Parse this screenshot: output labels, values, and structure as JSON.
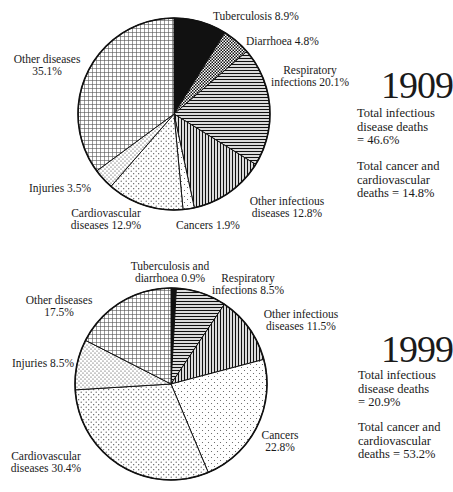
{
  "chart_data": [
    {
      "type": "pie",
      "title": "1909",
      "slices": [
        {
          "label": "Tuberculosis",
          "value": 8.9
        },
        {
          "label": "Diarrhoea",
          "value": 4.8
        },
        {
          "label": "Respiratory infections",
          "value": 20.1
        },
        {
          "label": "Other infectious diseases",
          "value": 12.8
        },
        {
          "label": "Cancers",
          "value": 1.9
        },
        {
          "label": "Cardiovascular diseases",
          "value": 12.9
        },
        {
          "label": "Injuries",
          "value": 3.5
        },
        {
          "label": "Other diseases",
          "value": 35.1
        }
      ],
      "annotations": [
        "Total infectious disease deaths = 46.6%",
        "Total cancer and cardiovascular deaths = 14.8%"
      ]
    },
    {
      "type": "pie",
      "title": "1999",
      "slices": [
        {
          "label": "Tuberculosis and diarrhoea",
          "value": 0.9
        },
        {
          "label": "Respiratory infections",
          "value": 8.5
        },
        {
          "label": "Other infectious diseases",
          "value": 11.5
        },
        {
          "label": "Cancers",
          "value": 22.8
        },
        {
          "label": "Cardiovascular diseases",
          "value": 30.4
        },
        {
          "label": "Injuries",
          "value": 8.5
        },
        {
          "label": "Other diseases",
          "value": 17.5
        }
      ],
      "annotations": [
        "Total infectious disease deaths = 20.9%",
        "Total cancer and cardiovascular deaths = 53.2%"
      ]
    }
  ],
  "chart1909": {
    "year": "1909",
    "labels": {
      "tb": "Tuberculosis 8.9%",
      "diarrhoea": "Diarrhoea 4.8%",
      "resp_1": "Respiratory",
      "resp_2": "infections 20.1%",
      "otherinf_1": "Other infectious",
      "otherinf_2": "diseases 12.8%",
      "cancers": "Cancers 1.9%",
      "cardio_1": "Cardiovascular",
      "cardio_2": "diseases 12.9%",
      "injuries": "Injuries 3.5%",
      "other_1": "Other diseases",
      "other_2": "35.1%"
    },
    "note1": [
      "Total infectious",
      "disease deaths",
      "= 46.6%"
    ],
    "note2": [
      "Total cancer and",
      "cardiovascular",
      "deaths = 14.8%"
    ]
  },
  "chart1999": {
    "year": "1999",
    "labels": {
      "tb_1": "Tuberculosis and",
      "tb_2": "diarrhoea 0.9%",
      "resp_1": "Respiratory",
      "resp_2": "infections 8.5%",
      "otherinf_1": "Other infectious",
      "otherinf_2": "diseases 11.5%",
      "cancers_1": "Cancers",
      "cancers_2": "22.8%",
      "cardio_1": "Cardiovascular",
      "cardio_2": "diseases 30.4%",
      "injuries": "Injuries 8.5%",
      "other_1": "Other diseases",
      "other_2": "17.5%"
    },
    "note1": [
      "Total infectious",
      "disease deaths",
      "= 20.9%"
    ],
    "note2": [
      "Total cancer and",
      "cardiovascular",
      "deaths = 53.2%"
    ]
  }
}
